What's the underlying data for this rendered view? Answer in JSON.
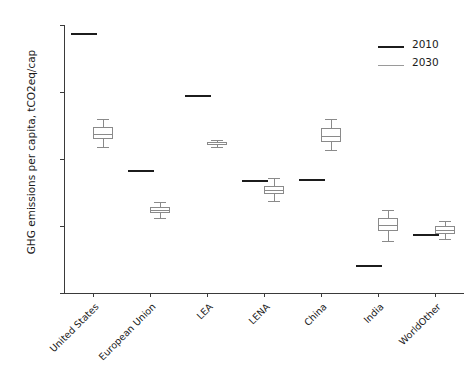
{
  "chart_data": {
    "type": "box",
    "title": "",
    "xlabel": "",
    "ylabel": "GHG emissions per capita, tCO2eq/cap",
    "ylim": [
      0,
      20
    ],
    "yticks": [
      0,
      5,
      10,
      15,
      20
    ],
    "ytick_labels": [
      "0",
      "5",
      "10",
      "15",
      "20"
    ],
    "grid": false,
    "legend_position": "upper right",
    "categories": [
      "United States",
      "European Union",
      "LEA",
      "LENA",
      "China",
      "India",
      "WorldOther"
    ],
    "series": [
      {
        "name": "2010",
        "type": "marker-line",
        "color": "#1c1c1c",
        "values": [
          19.4,
          9.2,
          14.8,
          8.4,
          8.5,
          2.1,
          4.4
        ]
      },
      {
        "name": "2030",
        "type": "boxplot",
        "color": "#8a8a8a",
        "boxes": [
          {
            "category": "United States",
            "whisker_low": 10.9,
            "q1": 11.5,
            "median": 11.9,
            "q3": 12.4,
            "whisker_high": 13.0
          },
          {
            "category": "European Union",
            "whisker_low": 5.6,
            "q1": 6.0,
            "median": 6.2,
            "q3": 6.4,
            "whisker_high": 6.8
          },
          {
            "category": "LEA",
            "whisker_low": 10.9,
            "q1": 11.05,
            "median": 11.15,
            "q3": 11.25,
            "whisker_high": 11.4
          },
          {
            "category": "LENA",
            "whisker_low": 6.9,
            "q1": 7.4,
            "median": 7.65,
            "q3": 8.0,
            "whisker_high": 8.6
          },
          {
            "category": "China",
            "whisker_low": 10.7,
            "q1": 11.3,
            "median": 11.7,
            "q3": 12.3,
            "whisker_high": 13.0
          },
          {
            "category": "India",
            "whisker_low": 3.9,
            "q1": 4.6,
            "median": 5.1,
            "q3": 5.6,
            "whisker_high": 6.2
          },
          {
            "category": "WorldOther",
            "whisker_low": 4.0,
            "q1": 4.4,
            "median": 4.7,
            "q3": 5.0,
            "whisker_high": 5.4
          }
        ]
      }
    ]
  },
  "legend": {
    "items": [
      {
        "label": "2010",
        "color": "#1c1c1c"
      },
      {
        "label": "2030",
        "color": "#9a9a9a"
      }
    ]
  }
}
